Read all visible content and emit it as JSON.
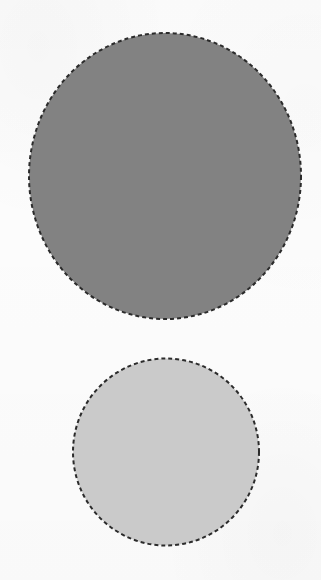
{
  "canvas": {
    "width": 321,
    "height": 580,
    "background_color": "#fcfcfc",
    "description": "Plain white field containing two dashed-outline gray circles stacked vertically"
  },
  "style": {
    "stroke_color": "#2b2b2b",
    "stroke_width": 2,
    "dash_length": 4,
    "dash_gap": 3,
    "dash_array": "4 3"
  },
  "shapes": [
    {
      "id": "large-circle",
      "label": "Large dark gray dashed circle",
      "type": "ellipse",
      "center_x": 165,
      "center_y": 176,
      "radius_x": 136,
      "radius_y": 143,
      "width": 272,
      "height": 286,
      "fill_color": "#828282",
      "stroke_color": "#2b2b2b",
      "stroke_width": 2,
      "dash_array": "4 3"
    },
    {
      "id": "small-circle",
      "label": "Small light gray dashed circle",
      "type": "ellipse",
      "center_x": 166,
      "center_y": 452,
      "radius_x": 93,
      "radius_y": 93.5,
      "width": 186,
      "height": 187,
      "fill_color": "#cacaca",
      "stroke_color": "#2b2b2b",
      "stroke_width": 2,
      "dash_array": "4 3"
    }
  ],
  "labels": {
    "none_visible": "No text, axis ticks, legend entries or annotations appear in this image"
  }
}
